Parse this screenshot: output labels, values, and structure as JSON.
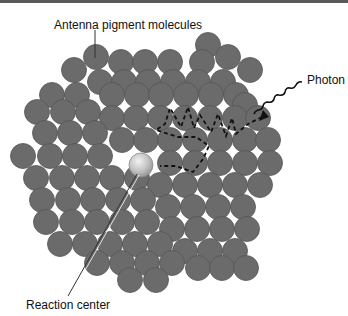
{
  "figure": {
    "labels": {
      "antenna": "Antenna pigment molecules",
      "photon": "Photon",
      "reaction_center": "Reaction center"
    },
    "colors": {
      "molecule_fill": "#6b6b6b",
      "molecule_stroke": "#555555",
      "reaction_center_fill": "#c9c9c9",
      "path_color": "#111111",
      "border": "#5a5a5a"
    },
    "reaction_center": {
      "cx": 141,
      "cy": 165,
      "r": 12
    },
    "molecule_radius": 12.5,
    "molecule_count": 101
  }
}
